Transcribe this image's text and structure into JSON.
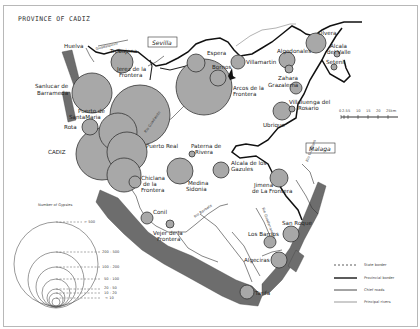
{
  "title": "PROVINCE OF CADIZ",
  "neighbors": {
    "sevilla": "Sevilla",
    "malaga": "Malaga",
    "huelva": "Huelva"
  },
  "rivers": {
    "guadalquivir": "Guadalquivir",
    "guadalete": "Rio Guadalete",
    "barbate": "Rio Barbate",
    "guadiaro": "Rio Guadiaro",
    "guadarranque": "Rio Guadarranque",
    "rio": "Rio"
  },
  "towns": [
    {
      "name": "Trebujena",
      "cx": 122,
      "cy": 62,
      "r": 11
    },
    {
      "name": "Jerez de la Frontera",
      "cx": 136,
      "cy": 114,
      "r": 30
    },
    {
      "name": "Sanlucar de Barrameda",
      "cx": 92,
      "cy": 93,
      "r": 20
    },
    {
      "name": "Puerto de Santa Maria",
      "cx": 117,
      "cy": 146,
      "r": 19
    },
    {
      "name": "Rota",
      "cx": 90,
      "cy": 127,
      "r": 8
    },
    {
      "name": "CADIZ",
      "cx": 102,
      "cy": 149,
      "r": 26
    },
    {
      "name": "Puerto Real",
      "cx": 126,
      "cy": 152,
      "r": 20
    },
    {
      "name": "Chiclana de la Frontera",
      "cx": 135,
      "cy": 180,
      "r": 7
    },
    {
      "name": "Espera",
      "cx": 196,
      "cy": 62,
      "r": 9
    },
    {
      "name": "Bornos",
      "cx": 218,
      "cy": 78,
      "r": 9
    },
    {
      "name": "Arcos de la Frontera",
      "cx": 200,
      "cy": 82,
      "r": 28
    },
    {
      "name": "Villamartin",
      "cx": 238,
      "cy": 61,
      "r": 7
    },
    {
      "name": "Algodonales",
      "cx": 287,
      "cy": 63,
      "r": 8
    },
    {
      "name": "Zahara",
      "cx": 289,
      "cy": 70,
      "r": 4
    },
    {
      "name": "Olvera",
      "cx": 316,
      "cy": 44,
      "r": 10
    },
    {
      "name": "Alcala del Valle",
      "cx": 337,
      "cy": 55,
      "r": 3
    },
    {
      "name": "Setenil",
      "cx": 334,
      "cy": 67,
      "r": 3
    },
    {
      "name": "Grazalema",
      "cx": 298,
      "cy": 83,
      "r": 6
    },
    {
      "name": "Ubrique",
      "cx": 286,
      "cy": 114,
      "r": 9
    },
    {
      "name": "Villaluenga del Rosario",
      "cx": 291,
      "cy": 111,
      "r": 3
    },
    {
      "name": "Paterna de Rivera",
      "cx": 193,
      "cy": 154,
      "r": 3
    },
    {
      "name": "Medina Sidonia",
      "cx": 184,
      "cy": 171,
      "r": 13
    },
    {
      "name": "Alcala de los Gazules",
      "cx": 220,
      "cy": 175,
      "r": 8
    },
    {
      "name": "Jimena de la Frontera",
      "cx": 281,
      "cy": 179,
      "r": 9
    },
    {
      "name": "Conil",
      "cx": 148,
      "cy": 218,
      "r": 6
    },
    {
      "name": "Vejer de la Frontera",
      "cx": 167,
      "cy": 232,
      "r": 4
    },
    {
      "name": "Los Barrios",
      "cx": 270,
      "cy": 243,
      "r": 6
    },
    {
      "name": "San Roque",
      "cx": 291,
      "cy": 233,
      "r": 8
    },
    {
      "name": "Algeciras",
      "cx": 279,
      "cy": 260,
      "r": 8
    },
    {
      "name": "Tarifa",
      "cx": 247,
      "cy": 291,
      "r": 7
    }
  ],
  "labels": {
    "trebujena": "Trebujena",
    "jerez_1": "Jerez de la",
    "jerez_2": "Frontera",
    "sanlucar_1": "Sanlucar de",
    "sanlucar_2": "Barrameda",
    "puerto_sm_1": "Puerto de",
    "puerto_sm_2": "SantaMaria",
    "rota": "Rota",
    "cadiz": "CADIZ",
    "puerto_real": "Puerto Real",
    "chiclana_1": "Chiclana",
    "chiclana_2": "de la",
    "chiclana_3": "Frontera",
    "espera": "Espera",
    "bornos": "Bornos",
    "arcos_1": "Arcos de la",
    "arcos_2": "Frontera",
    "villamartin": "Villamartin",
    "algodonales": "Algodonales",
    "zahara": "Zahara",
    "olvera": "Olvera",
    "alcala_valle_1": "Alcala",
    "alcala_valle_2": "del Valle",
    "setenil": "Setenil",
    "grazalema": "Grazalema",
    "villaluenga_1": "Villaluenga del",
    "villaluenga_2": "Rosario",
    "ubrique": "Ubrique",
    "paterna_1": "Paterna de",
    "paterna_2": "Rivera",
    "medina_1": "Medina",
    "medina_2": "Sidonia",
    "alcala_gaz_1": "Alcala de los",
    "alcala_gaz_2": "Gazules",
    "jimena_1": "Jimena",
    "jimena_2": "de La Frontera",
    "conil": "Conil",
    "vejer_1": "Vejer de la",
    "vejer_2": "Frontera",
    "los_barrios": "Los Barrios",
    "san_roque": "San Roque",
    "algeciras": "Algeciras",
    "tarifa": "Tarifa"
  },
  "scale_bar": {
    "ticks": [
      "0",
      "2.5",
      "5",
      "10",
      "15",
      "20",
      "25km"
    ]
  },
  "gypsies_legend": {
    "title": "Number of Gypsies",
    "ranges": [
      "> 500",
      "200 - 500",
      "100 - 200",
      "50 - 100",
      "20 - 50",
      "10 - 20",
      "< 10"
    ]
  },
  "line_legend": [
    {
      "label": "State border",
      "style": "dashed"
    },
    {
      "label": "Provincial border",
      "style": "thick"
    },
    {
      "label": "Chief roads",
      "style": "medium"
    },
    {
      "label": "Principal rivers",
      "style": "thin"
    }
  ]
}
